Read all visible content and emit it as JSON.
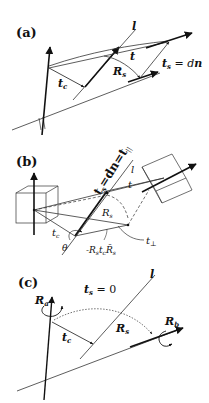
{
  "panels": [
    {
      "id": "a",
      "label": "(a)",
      "labels": {
        "line": "l",
        "t": "t",
        "tc": "t",
        "tc_sub": "c",
        "Rs": "R",
        "Rs_sub": "s",
        "ts_eq": "t",
        "ts_sub": "s",
        "ts_rhs": " = d",
        "ts_n": "n"
      }
    },
    {
      "id": "b",
      "label": "(b)",
      "labels": {
        "line": "l",
        "t_axis": "t",
        "t_axis_sub": "s",
        "t_axis_rest": "=dn=t",
        "t_axis_par": "||",
        "t": "t",
        "Rs": "R",
        "Rs_sub": "s",
        "tc": "t",
        "tc_sub": "c",
        "theta": "θ",
        "expr": "-R",
        "expr_s1": "s",
        "expr_t": "t",
        "expr_c": "c",
        "expr_R": "R̄",
        "expr_s2": "s",
        "tperp": "t",
        "tperp_sub": "⊥"
      }
    },
    {
      "id": "c",
      "label": "(c)",
      "labels": {
        "line": "l",
        "ts_zero": "t",
        "ts_zero_sub": "s",
        "ts_zero_rhs": " = 0",
        "Ra": "R",
        "Ra_sub": "a",
        "Rb": "R",
        "Rb_sub": "b",
        "Rs": "R",
        "Rs_sub": "s",
        "tc": "t",
        "tc_sub": "c"
      }
    }
  ],
  "colors": {
    "ink": "#111111",
    "thin": "#333333",
    "background": "#ffffff"
  }
}
